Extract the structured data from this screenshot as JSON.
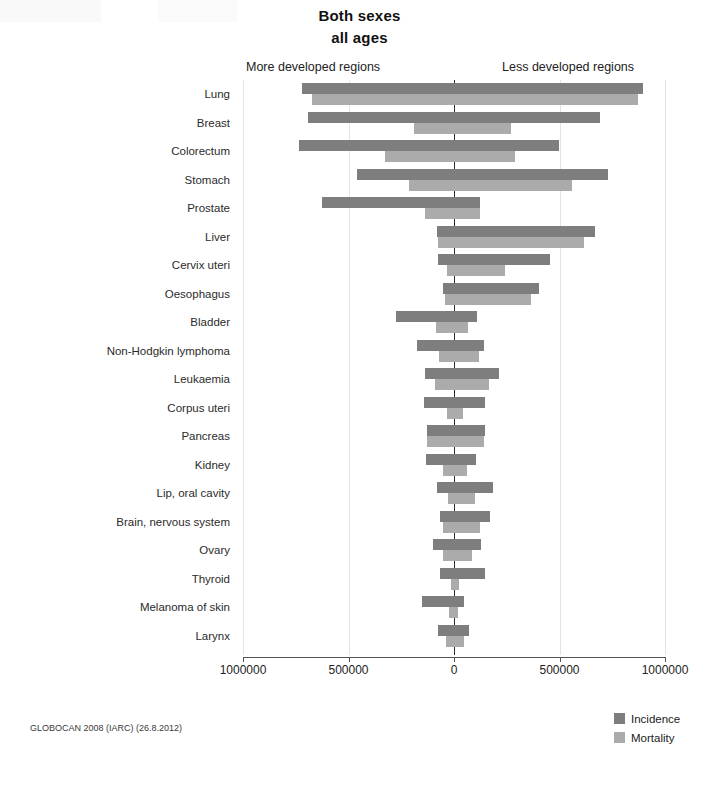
{
  "title": "Both sexes",
  "subtitle": "all ages",
  "left_region_label": "More developed regions",
  "right_region_label": "Less developed regions",
  "source_note": "GLOBOCAN 2008 (IARC) (26.8.2012)",
  "legend": [
    {
      "label": "Incidence",
      "color": "#7e7e7e",
      "key": "incidence"
    },
    {
      "label": "Mortality",
      "color": "#ababab",
      "key": "mortality"
    }
  ],
  "axis": {
    "tick_labels": [
      "1000000",
      "500000",
      "0",
      "500000",
      "1000000"
    ],
    "tick_values": [
      -1000000,
      -500000,
      0,
      500000,
      1000000
    ],
    "min": -1000000,
    "max": 1000000
  },
  "chart_data": {
    "type": "bar",
    "orientation": "horizontal",
    "layout": "diverging-population-pyramid",
    "subtitle": "all ages",
    "xlabel": "",
    "ylabel": "",
    "xlim": [
      -1000000,
      1000000
    ],
    "grid": true,
    "legend_position": "bottom-right",
    "left_side": "More developed regions",
    "right_side": "Less developed regions",
    "note": "Left-side values are plotted to the left of zero (more developed regions); right-side values to the right of zero (less developed regions). Values are absolute case counts.",
    "categories": [
      "Lung",
      "Breast",
      "Colorectum",
      "Stomach",
      "Prostate",
      "Liver",
      "Cervix uteri",
      "Oesophagus",
      "Bladder",
      "Non-Hodgkin lymphoma",
      "Leukaemia",
      "Corpus uteri",
      "Pancreas",
      "Kidney",
      "Lip, oral cavity",
      "Brain, nervous system",
      "Ovary",
      "Thyroid",
      "Melanoma of skin",
      "Larynx"
    ],
    "series": [
      {
        "name": "Incidence",
        "color": "#7e7e7e",
        "more_developed": [
          722000,
          692000,
          734000,
          458000,
          626000,
          82000,
          76000,
          52000,
          277000,
          173000,
          137000,
          142000,
          130000,
          135000,
          79000,
          68000,
          100000,
          64000,
          151000,
          78000
        ],
        "less_developed": [
          895000,
          692000,
          498000,
          731000,
          125000,
          667000,
          453000,
          404000,
          108000,
          141000,
          214000,
          145000,
          148000,
          102000,
          184000,
          170000,
          126000,
          149000,
          47000,
          72000
        ]
      },
      {
        "name": "Mortality",
        "color": "#ababab",
        "more_developed": [
          674000,
          189000,
          329000,
          213000,
          136000,
          77000,
          31000,
          42000,
          87000,
          72000,
          89000,
          33000,
          128000,
          53000,
          29000,
          52000,
          54000,
          13000,
          26000,
          37000
        ]
      }
    ],
    "bars": [
      {
        "category": "Lung",
        "incidence_left": 722000,
        "incidence_right": 895000,
        "mortality_left": 674000,
        "mortality_right": 871000
      },
      {
        "category": "Breast",
        "incidence_left": 692000,
        "incidence_right": 692000,
        "mortality_left": 189000,
        "mortality_right": 269000
      },
      {
        "category": "Colorectum",
        "incidence_left": 734000,
        "incidence_right": 498000,
        "mortality_left": 329000,
        "mortality_right": 289000
      },
      {
        "category": "Stomach",
        "incidence_left": 458000,
        "incidence_right": 731000,
        "mortality_left": 213000,
        "mortality_right": 559000
      },
      {
        "category": "Prostate",
        "incidence_left": 626000,
        "incidence_right": 125000,
        "mortality_left": 136000,
        "mortality_right": 122000
      },
      {
        "category": "Liver",
        "incidence_left": 82000,
        "incidence_right": 667000,
        "mortality_left": 77000,
        "mortality_right": 617000
      },
      {
        "category": "Cervix uteri",
        "incidence_left": 76000,
        "incidence_right": 453000,
        "mortality_left": 31000,
        "mortality_right": 242000
      },
      {
        "category": "Oesophagus",
        "incidence_left": 52000,
        "incidence_right": 404000,
        "mortality_left": 42000,
        "mortality_right": 365000
      },
      {
        "category": "Bladder",
        "incidence_left": 277000,
        "incidence_right": 108000,
        "mortality_left": 87000,
        "mortality_right": 64000
      },
      {
        "category": "Non-Hodgkin lymphoma",
        "incidence_left": 173000,
        "incidence_right": 141000,
        "mortality_left": 72000,
        "mortality_right": 119000
      },
      {
        "category": "Leukaemia",
        "incidence_left": 137000,
        "incidence_right": 214000,
        "mortality_left": 89000,
        "mortality_right": 168000
      },
      {
        "category": "Corpus uteri",
        "incidence_left": 142000,
        "incidence_right": 145000,
        "mortality_left": 33000,
        "mortality_right": 41000
      },
      {
        "category": "Pancreas",
        "incidence_left": 130000,
        "incidence_right": 148000,
        "mortality_left": 128000,
        "mortality_right": 143000
      },
      {
        "category": "Kidney",
        "incidence_left": 135000,
        "incidence_right": 102000,
        "mortality_left": 53000,
        "mortality_right": 63000
      },
      {
        "category": "Lip, oral cavity",
        "incidence_left": 79000,
        "incidence_right": 184000,
        "mortality_left": 29000,
        "mortality_right": 99000
      },
      {
        "category": "Brain, nervous system",
        "incidence_left": 68000,
        "incidence_right": 170000,
        "mortality_left": 52000,
        "mortality_right": 122000
      },
      {
        "category": "Ovary",
        "incidence_left": 100000,
        "incidence_right": 126000,
        "mortality_left": 54000,
        "mortality_right": 86000
      },
      {
        "category": "Thyroid",
        "incidence_left": 64000,
        "incidence_right": 149000,
        "mortality_left": 13000,
        "mortality_right": 23000
      },
      {
        "category": "Melanoma of skin",
        "incidence_left": 151000,
        "incidence_right": 47000,
        "mortality_left": 26000,
        "mortality_right": 20000
      },
      {
        "category": "Larynx",
        "incidence_left": 78000,
        "incidence_right": 72000,
        "mortality_left": 37000,
        "mortality_right": 47000
      }
    ]
  }
}
